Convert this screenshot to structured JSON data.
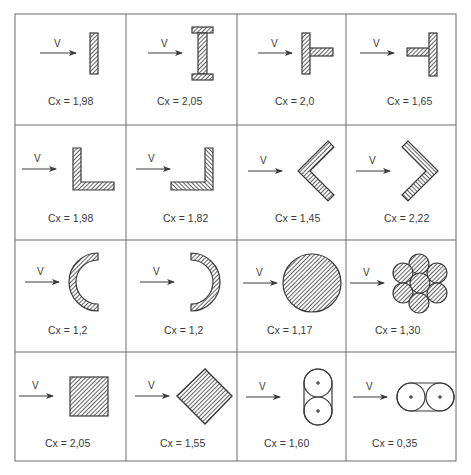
{
  "colors": {
    "line": "#3a3a3a",
    "grid": "#6a6a6a",
    "hatch_fill": "#ffffff",
    "background": "#ffffff"
  },
  "grid": {
    "columns": 4,
    "rows": 4,
    "x_lines": [
      15,
      126,
      237,
      346,
      456
    ],
    "y_lines": [
      14,
      125,
      240,
      352,
      461
    ]
  },
  "velocity_label": "V",
  "coefficient_symbol": "C",
  "coefficient_subscript": "x",
  "cells": [
    {
      "row": 0,
      "col": 0,
      "shape": "flat-plate",
      "label": "Cx = 1,98",
      "value": "1,98"
    },
    {
      "row": 0,
      "col": 1,
      "shape": "i-beam",
      "label": "Cx = 2,05",
      "value": "2,05"
    },
    {
      "row": 0,
      "col": 2,
      "shape": "t-section-flange-front",
      "label": "Cx = 2,0",
      "value": "2,0"
    },
    {
      "row": 0,
      "col": 3,
      "shape": "t-section-flange-back",
      "label": "Cx = 1,65",
      "value": "1,65"
    },
    {
      "row": 1,
      "col": 0,
      "shape": "angle-opening-right",
      "label": "Cx = 1,98",
      "value": "1,98"
    },
    {
      "row": 1,
      "col": 1,
      "shape": "angle-opening-left",
      "label": "Cx = 1,82",
      "value": "1,82"
    },
    {
      "row": 1,
      "col": 2,
      "shape": "chevron-left",
      "label": "Cx = 1,45",
      "value": "1,45"
    },
    {
      "row": 1,
      "col": 3,
      "shape": "chevron-right",
      "label": "Cx = 2,22",
      "value": "2,22"
    },
    {
      "row": 2,
      "col": 0,
      "shape": "half-pipe-convex",
      "label": "Cx = 1,2",
      "value": "1,2"
    },
    {
      "row": 2,
      "col": 1,
      "shape": "half-pipe-concave",
      "label": "Cx = 1,2",
      "value": "1,2"
    },
    {
      "row": 2,
      "col": 2,
      "shape": "circle",
      "label": "Cx = 1,17",
      "value": "1,17"
    },
    {
      "row": 2,
      "col": 3,
      "shape": "strand-bundle",
      "label": "Cx = 1,30",
      "value": "1,30"
    },
    {
      "row": 3,
      "col": 0,
      "shape": "square",
      "label": "Cx = 2,05",
      "value": "2,05"
    },
    {
      "row": 3,
      "col": 1,
      "shape": "diamond",
      "label": "Cx = 1,55",
      "value": "1,55"
    },
    {
      "row": 3,
      "col": 2,
      "shape": "twin-cylinders-vertical",
      "label": "Cx = 1,60",
      "value": "1,60"
    },
    {
      "row": 3,
      "col": 3,
      "shape": "twin-cylinders-horizontal",
      "label": "Cx = 0,35",
      "value": "0,35"
    }
  ]
}
